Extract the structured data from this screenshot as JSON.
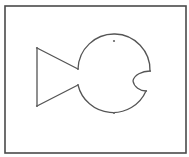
{
  "drawing": {
    "title": "Fish shape",
    "colors": {
      "background": "#ffffff",
      "frame": "#4a4a4a",
      "stroke": "#555555",
      "node": "#666666"
    },
    "frame": {
      "x": 5,
      "y": 6,
      "width": 181,
      "height": 147
    },
    "shapes": [
      {
        "name": "tail",
        "type": "polyline",
        "points": [
          [
            78,
            69
          ],
          [
            37,
            48
          ],
          [
            37,
            106
          ],
          [
            78,
            85
          ]
        ]
      },
      {
        "name": "body",
        "type": "arc",
        "center": [
          114,
          77
        ],
        "radius": 36
      },
      {
        "name": "mouth",
        "type": "notch",
        "top": [
          150,
          71
        ],
        "inner": [
          133,
          81
        ],
        "bottom": [
          146,
          91
        ]
      }
    ],
    "nodes": [
      [
        37,
        48
      ],
      [
        37,
        106
      ],
      [
        78,
        69
      ],
      [
        78,
        85
      ],
      [
        114,
        41
      ],
      [
        114,
        113
      ],
      [
        150,
        71
      ],
      [
        146,
        91
      ]
    ]
  }
}
